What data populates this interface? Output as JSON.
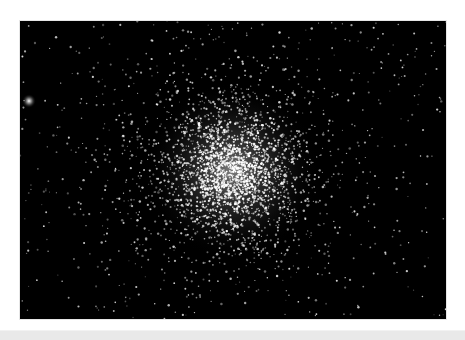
{
  "page": {
    "background": "#ffffff",
    "top_text": "",
    "bottom_bar_color": "#e9e9e9"
  },
  "photo": {
    "subject": "globular star cluster",
    "background_color": "#000000",
    "star_color": "#ffffff",
    "cluster_center": [
      212,
      150
    ],
    "cluster_core_radius": 55,
    "bright_field_star": [
      9,
      80
    ]
  }
}
